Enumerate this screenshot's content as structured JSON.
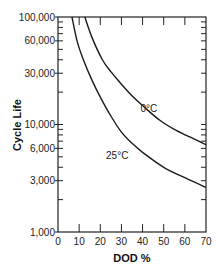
{
  "chart_data": {
    "type": "line",
    "title": "",
    "xlabel": "DOD %",
    "ylabel": "Cycle Life",
    "xlim": [
      0,
      70
    ],
    "ylim": [
      1000,
      100000
    ],
    "yscale": "log",
    "grid": false,
    "legend": "inline labels",
    "x_ticks": [
      0,
      10,
      20,
      30,
      40,
      50,
      60,
      70
    ],
    "x_tick_labels": [
      "0",
      "10",
      "20",
      "30",
      "40",
      "50",
      "60",
      "70"
    ],
    "y_ticks": [
      100000,
      60000,
      30000,
      10000,
      6000,
      3000,
      1000
    ],
    "y_tick_labels": [
      "100,000",
      "60,000",
      "30,000",
      "10,000",
      "6,000",
      "3,000",
      "1,000"
    ],
    "series": [
      {
        "name": "0°C",
        "label_pos": [
          43,
          13000
        ],
        "points": [
          [
            12.7,
            100000
          ],
          [
            16,
            65000
          ],
          [
            21,
            40000
          ],
          [
            25,
            31000
          ],
          [
            29,
            25000
          ],
          [
            35,
            18500
          ],
          [
            40,
            15000
          ],
          [
            48,
            11000
          ],
          [
            55,
            9000
          ],
          [
            62,
            7700
          ],
          [
            70,
            6500
          ]
        ]
      },
      {
        "name": "25°C",
        "label_pos": [
          28,
          4800
        ],
        "points": [
          [
            6.6,
            100000
          ],
          [
            9,
            60000
          ],
          [
            12,
            40000
          ],
          [
            16,
            26000
          ],
          [
            20,
            18000
          ],
          [
            25,
            12000
          ],
          [
            30,
            8500
          ],
          [
            35,
            6700
          ],
          [
            40,
            5500
          ],
          [
            50,
            4000
          ],
          [
            60,
            3200
          ],
          [
            70,
            2600
          ]
        ]
      }
    ]
  }
}
